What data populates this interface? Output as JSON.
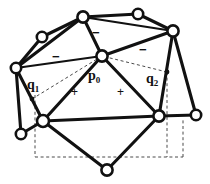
{
  "figure": {
    "width": 210,
    "height": 184,
    "background_color": "#ffffff",
    "stroke_color": "#111111",
    "dashed_color": "#4a4a4a"
  },
  "labels": {
    "p0": {
      "base": "p",
      "sub": "0",
      "x": 88,
      "y": 69
    },
    "q1": {
      "base": "q",
      "sub": "1",
      "x": 27,
      "y": 78
    },
    "q2": {
      "base": "q",
      "sub": "2",
      "x": 146,
      "y": 72
    }
  },
  "signs": {
    "plus": [
      {
        "text": "+",
        "x": 71,
        "y": 86
      },
      {
        "text": "+",
        "x": 117,
        "y": 86
      }
    ],
    "minus": [
      {
        "text": "−",
        "x": 52,
        "y": 50
      },
      {
        "text": "−",
        "x": 92,
        "y": 26
      },
      {
        "text": "−",
        "x": 139,
        "y": 43
      }
    ]
  },
  "vertices": [
    {
      "id": "v0",
      "name": "top-left-outer",
      "x": 42,
      "y": 37,
      "r": 5.2
    },
    {
      "id": "v1",
      "name": "left-outer",
      "x": 16,
      "y": 68,
      "r": 5.2
    },
    {
      "id": "v2",
      "name": "top-center",
      "x": 83,
      "y": 17,
      "r": 5.6
    },
    {
      "id": "v3",
      "name": "top-right-outer",
      "x": 138,
      "y": 14,
      "r": 5.2
    },
    {
      "id": "v4",
      "name": "right-upper",
      "x": 173,
      "y": 31,
      "r": 5.6
    },
    {
      "id": "v5",
      "name": "center-p0",
      "x": 102,
      "y": 56,
      "r": 5.6
    },
    {
      "id": "v6",
      "name": "lower-left-hub",
      "x": 43,
      "y": 121,
      "r": 6.0
    },
    {
      "id": "v7",
      "name": "left-bottom-outer",
      "x": 21,
      "y": 134,
      "r": 5.2
    },
    {
      "id": "v8",
      "name": "lower-right-hub",
      "x": 159,
      "y": 116,
      "r": 5.6
    },
    {
      "id": "v9",
      "name": "right-bottom-outer",
      "x": 196,
      "y": 115,
      "r": 5.2
    },
    {
      "id": "v10",
      "name": "bottom-center",
      "x": 107,
      "y": 170,
      "r": 5.6
    }
  ],
  "sample_points": [
    {
      "id": "s1",
      "name": "q1-sample-dot",
      "x": 32,
      "y": 99,
      "r": 2.4
    },
    {
      "id": "s2",
      "name": "q2-sample-dot",
      "x": 167,
      "y": 72,
      "r": 2.4
    }
  ],
  "edges_solid": [
    {
      "from": "v0",
      "to": "v1"
    },
    {
      "from": "v0",
      "to": "v2"
    },
    {
      "from": "v1",
      "to": "v2"
    },
    {
      "from": "v2",
      "to": "v3"
    },
    {
      "from": "v2",
      "to": "v5"
    },
    {
      "from": "v3",
      "to": "v4"
    },
    {
      "from": "v2",
      "to": "v4"
    },
    {
      "from": "v4",
      "to": "v5"
    },
    {
      "from": "v1",
      "to": "v5"
    },
    {
      "from": "v4",
      "to": "v8"
    },
    {
      "from": "v4",
      "to": "v9"
    },
    {
      "from": "v1",
      "to": "v6"
    },
    {
      "from": "v1",
      "to": "v7"
    },
    {
      "from": "v6",
      "to": "v7"
    },
    {
      "from": "v5",
      "to": "v6"
    },
    {
      "from": "v5",
      "to": "v8"
    },
    {
      "from": "v6",
      "to": "v8"
    },
    {
      "from": "v6",
      "to": "v10"
    },
    {
      "from": "v8",
      "to": "v9"
    },
    {
      "from": "v8",
      "to": "v10"
    }
  ],
  "edges_dashed": [
    {
      "from_point": "s1",
      "to": "v5"
    },
    {
      "from_point": "s2",
      "to": "v5"
    }
  ],
  "dashed_box": {
    "name": "bounding-box",
    "left": 35,
    "top": 95,
    "right": 183,
    "bottom": 157
  },
  "dashed_verticals": [
    {
      "x": 35,
      "y1": 95,
      "y2": 157
    },
    {
      "x": 167,
      "y1": 72,
      "y2": 157
    }
  ]
}
